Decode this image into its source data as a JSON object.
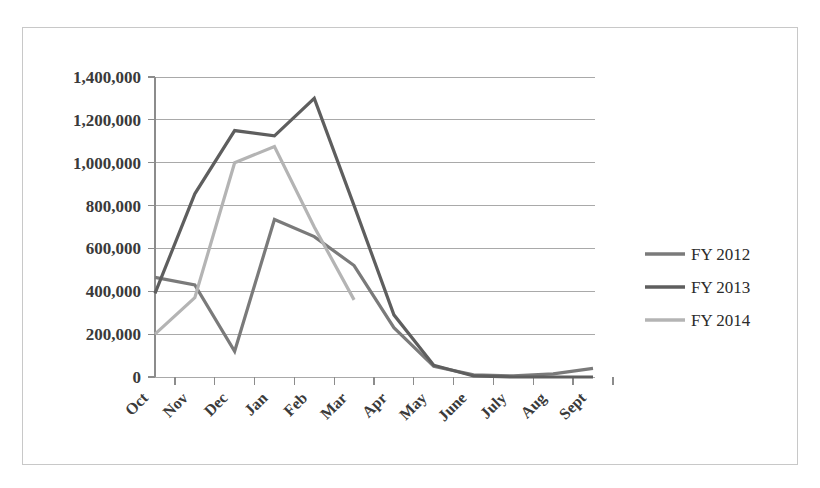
{
  "chart_data": {
    "type": "line",
    "title": "",
    "subtitle": "",
    "xlabel": "",
    "ylabel": "",
    "categories": [
      "Oct",
      "Nov",
      "Dec",
      "Jan",
      "Feb",
      "Mar",
      "Apr",
      "May",
      "June",
      "July",
      "Aug",
      "Sept"
    ],
    "ylim": [
      0,
      1400000
    ],
    "ytick_values": [
      0,
      200000,
      400000,
      600000,
      800000,
      1000000,
      1200000,
      1400000
    ],
    "ytick_labels": [
      "0",
      "200,000",
      "400,000",
      "600,000",
      "800,000",
      "1,000,000",
      "1,200,000",
      "1,400,000"
    ],
    "grid": true,
    "legend_position": "right",
    "series": [
      {
        "name": "FY 2012",
        "color": "#7a7a7a",
        "values": [
          465000,
          430000,
          120000,
          735000,
          655000,
          520000,
          230000,
          50000,
          10000,
          5000,
          15000,
          40000
        ]
      },
      {
        "name": "FY 2013",
        "color": "#5e5e5e",
        "values": [
          390000,
          855000,
          1150000,
          1125000,
          1300000,
          800000,
          290000,
          55000,
          5000,
          0,
          0,
          0
        ]
      },
      {
        "name": "FY 2014",
        "color": "#b4b4b4",
        "values": [
          200000,
          370000,
          1000000,
          1075000,
          700000,
          360000,
          null,
          null,
          null,
          null,
          null,
          null
        ]
      }
    ]
  },
  "legend": {
    "items": [
      {
        "label": "FY 2012"
      },
      {
        "label": "FY 2013"
      },
      {
        "label": "FY 2014"
      }
    ]
  },
  "colors": {
    "border": "#c8c8c8",
    "gridline": "#a9a9a9",
    "axis": "#8c8c8c",
    "text": "#3a3a3a",
    "background": "#ffffff"
  }
}
